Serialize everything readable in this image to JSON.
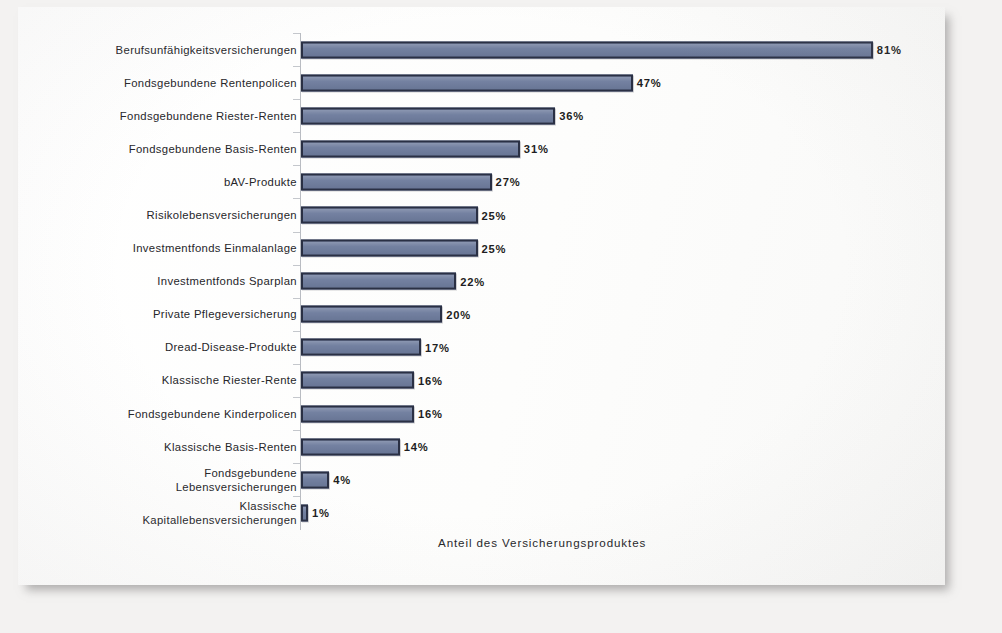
{
  "chart_data": {
    "type": "bar",
    "orientation": "horizontal",
    "title": "",
    "xlabel": "Anteil des Versicherungsproduktes",
    "ylabel": "",
    "xlim": [
      0,
      81
    ],
    "grid": false,
    "legend": null,
    "value_suffix": "%",
    "categories": [
      "Berufsunfähigkeitsversicherungen",
      "Fondsgebundene Rentenpolicen",
      "Fondsgebundene Riester-Renten",
      "Fondsgebundene Basis-Renten",
      "bAV-Produkte",
      "Risikolebensversicherungen",
      "Investmentfonds Einmalanlage",
      "Investmentfonds Sparplan",
      "Private Pflegeversicherung",
      "Dread-Disease-Produkte",
      "Klassische Riester-Rente",
      "Fondsgebundene Kinderpolicen",
      "Klassische Basis-Renten",
      "Fondsgebundene\nLebensversicherungen",
      "Klassische\nKapitallebensversicherungen"
    ],
    "values": [
      81,
      47,
      36,
      31,
      27,
      25,
      25,
      22,
      20,
      17,
      16,
      16,
      14,
      4,
      1
    ],
    "value_labels": [
      "81%",
      "47%",
      "36%",
      "31%",
      "27%",
      "25%",
      "25%",
      "22%",
      "20%",
      "17%",
      "16%",
      "16%",
      "14%",
      "4%",
      "1%"
    ],
    "colors": {
      "bar_fill": "#6e7c9d",
      "bar_border": "#2a3044",
      "axis_line": "#b9bcc2",
      "text": "#26262a",
      "page": "#fefefe",
      "backdrop": "#f3f2f1"
    }
  },
  "axis": {
    "caption": "Anteil des Versicherungsproduktes"
  }
}
